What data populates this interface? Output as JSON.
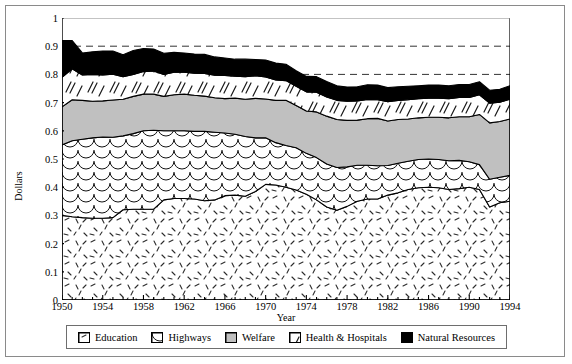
{
  "chart_data": {
    "type": "area",
    "title": "",
    "xlabel": "Year",
    "ylabel": "Dollars",
    "xlim": [
      1950,
      1994
    ],
    "ylim": [
      0,
      1
    ],
    "ytick_labels": [
      "0",
      "0.1",
      "0.2",
      "0.3",
      "0.4",
      "0.5",
      "0.6",
      "0.7",
      "0.8",
      "0.9",
      "1"
    ],
    "ytick_values": [
      0,
      0.1,
      0.2,
      0.3,
      0.4,
      0.5,
      0.6,
      0.7,
      0.8,
      0.9,
      1
    ],
    "xtick_labels": [
      "1950",
      "1954",
      "1958",
      "1962",
      "1966",
      "1970",
      "1974",
      "1978",
      "1982",
      "1986",
      "1990",
      "1994"
    ],
    "xtick_values": [
      1950,
      1954,
      1958,
      1962,
      1966,
      1970,
      1974,
      1978,
      1982,
      1986,
      1990,
      1994
    ],
    "grid": "horizontal-dashed",
    "stacked": true,
    "legend_position": "bottom",
    "x": [
      1950,
      1951,
      1952,
      1953,
      1954,
      1955,
      1956,
      1957,
      1958,
      1959,
      1960,
      1961,
      1962,
      1963,
      1964,
      1965,
      1966,
      1967,
      1968,
      1969,
      1970,
      1971,
      1972,
      1973,
      1974,
      1975,
      1976,
      1977,
      1978,
      1979,
      1980,
      1981,
      1982,
      1983,
      1984,
      1985,
      1986,
      1987,
      1988,
      1989,
      1990,
      1991,
      1992,
      1993,
      1994
    ],
    "series": [
      {
        "name": "Education",
        "color": "#ffffff",
        "pattern": "sparse-dashes",
        "values": [
          0.3,
          0.295,
          0.292,
          0.29,
          0.29,
          0.292,
          0.32,
          0.322,
          0.322,
          0.322,
          0.355,
          0.36,
          0.36,
          0.358,
          0.352,
          0.355,
          0.37,
          0.372,
          0.368,
          0.385,
          0.41,
          0.408,
          0.4,
          0.39,
          0.375,
          0.355,
          0.33,
          0.318,
          0.332,
          0.35,
          0.358,
          0.358,
          0.372,
          0.38,
          0.392,
          0.398,
          0.4,
          0.398,
          0.392,
          0.395,
          0.4,
          0.392,
          0.33,
          0.345,
          0.35
        ]
      },
      {
        "name": "Highways",
        "color": "#ffffff",
        "pattern": "fish-scale",
        "values": [
          0.25,
          0.27,
          0.278,
          0.285,
          0.288,
          0.285,
          0.262,
          0.268,
          0.278,
          0.28,
          0.245,
          0.24,
          0.24,
          0.24,
          0.246,
          0.24,
          0.222,
          0.216,
          0.212,
          0.19,
          0.165,
          0.15,
          0.148,
          0.15,
          0.145,
          0.15,
          0.152,
          0.152,
          0.14,
          0.128,
          0.12,
          0.118,
          0.105,
          0.105,
          0.1,
          0.1,
          0.1,
          0.1,
          0.102,
          0.1,
          0.09,
          0.088,
          0.098,
          0.09,
          0.092
        ]
      },
      {
        "name": "Welfare",
        "color": "#c0c0c0",
        "pattern": "solid-gray",
        "values": [
          0.135,
          0.145,
          0.138,
          0.13,
          0.128,
          0.132,
          0.13,
          0.132,
          0.13,
          0.128,
          0.122,
          0.128,
          0.13,
          0.128,
          0.125,
          0.122,
          0.122,
          0.128,
          0.132,
          0.14,
          0.138,
          0.15,
          0.16,
          0.15,
          0.15,
          0.162,
          0.17,
          0.17,
          0.165,
          0.16,
          0.165,
          0.168,
          0.158,
          0.155,
          0.15,
          0.148,
          0.148,
          0.15,
          0.152,
          0.155,
          0.16,
          0.178,
          0.2,
          0.198,
          0.2
        ]
      },
      {
        "name": "Health & Hospitals",
        "color": "#ffffff",
        "pattern": "slashes",
        "values": [
          0.105,
          0.11,
          0.09,
          0.095,
          0.092,
          0.092,
          0.08,
          0.078,
          0.08,
          0.082,
          0.078,
          0.08,
          0.078,
          0.078,
          0.08,
          0.08,
          0.082,
          0.078,
          0.08,
          0.08,
          0.078,
          0.072,
          0.07,
          0.068,
          0.068,
          0.07,
          0.068,
          0.068,
          0.068,
          0.068,
          0.068,
          0.066,
          0.068,
          0.068,
          0.068,
          0.068,
          0.068,
          0.068,
          0.068,
          0.068,
          0.068,
          0.07,
          0.07,
          0.068,
          0.07
        ]
      },
      {
        "name": "Natural Resources",
        "color": "#000000",
        "pattern": "solid-black",
        "values": [
          0.13,
          0.1,
          0.078,
          0.08,
          0.085,
          0.082,
          0.078,
          0.085,
          0.082,
          0.078,
          0.075,
          0.07,
          0.068,
          0.068,
          0.068,
          0.065,
          0.062,
          0.06,
          0.062,
          0.058,
          0.06,
          0.06,
          0.058,
          0.055,
          0.055,
          0.055,
          0.055,
          0.052,
          0.05,
          0.05,
          0.052,
          0.052,
          0.05,
          0.048,
          0.048,
          0.046,
          0.046,
          0.046,
          0.046,
          0.046,
          0.046,
          0.046,
          0.046,
          0.046,
          0.048
        ]
      }
    ]
  },
  "legend": {
    "items": [
      {
        "label": "Education",
        "swatch": "education-swatch"
      },
      {
        "label": "Highways",
        "swatch": "highways-swatch"
      },
      {
        "label": "Welfare",
        "swatch": "welfare-swatch"
      },
      {
        "label": "Health & Hospitals",
        "swatch": "health-hospitals-swatch"
      },
      {
        "label": "Natural Resources",
        "swatch": "natural-resources-swatch"
      }
    ]
  }
}
